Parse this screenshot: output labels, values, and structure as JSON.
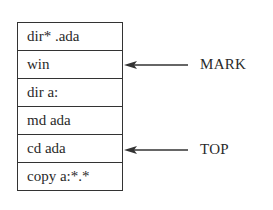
{
  "diagram": {
    "type": "stack",
    "cells": [
      {
        "label": "dir* .ada"
      },
      {
        "label": "win"
      },
      {
        "label": "dir a:"
      },
      {
        "label": "md ada"
      },
      {
        "label": "cd ada"
      },
      {
        "label": "copy a:*.*"
      }
    ],
    "pointers": [
      {
        "label": "MARK",
        "target_index": 1
      },
      {
        "label": "TOP",
        "target_index": 4
      }
    ],
    "colors": {
      "line": "#333333",
      "text": "#2a2a2a",
      "background": "#ffffff"
    }
  }
}
